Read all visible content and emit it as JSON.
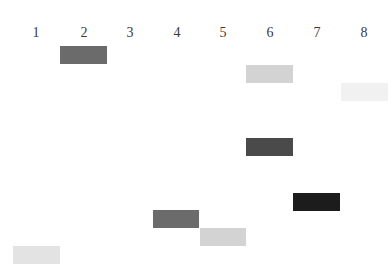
{
  "figure": {
    "type": "gel-band-diagram",
    "lanes": [
      {
        "label": "1",
        "x_center": 36
      },
      {
        "label": "2",
        "x_center": 84
      },
      {
        "label": "3",
        "x_center": 130
      },
      {
        "label": "4",
        "x_center": 177
      },
      {
        "label": "5",
        "x_center": 223
      },
      {
        "label": "6",
        "x_center": 270
      },
      {
        "label": "7",
        "x_center": 317
      },
      {
        "label": "8",
        "x_center": 364
      }
    ],
    "bands": [
      {
        "lane": "2",
        "left": 60,
        "top": 46,
        "width": 47,
        "color": "#6b6b6b"
      },
      {
        "lane": "6",
        "left": 246,
        "top": 65,
        "width": 47,
        "color": "#d3d3d3"
      },
      {
        "lane": "8",
        "left": 341,
        "top": 83,
        "width": 47,
        "color": "#f1f1f1"
      },
      {
        "lane": "6",
        "left": 246,
        "top": 138,
        "width": 47,
        "color": "#4a4a4a"
      },
      {
        "lane": "7",
        "left": 293,
        "top": 193,
        "width": 47,
        "color": "#1c1c1c"
      },
      {
        "lane": "4",
        "left": 153,
        "top": 210,
        "width": 46,
        "color": "#6b6b6b"
      },
      {
        "lane": "5",
        "left": 200,
        "top": 228,
        "width": 46,
        "color": "#d3d3d3"
      },
      {
        "lane": "1",
        "left": 13,
        "top": 246,
        "width": 47,
        "color": "#e3e3e3"
      }
    ]
  }
}
